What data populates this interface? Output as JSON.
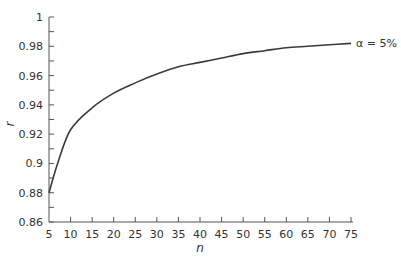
{
  "chart_data": {
    "type": "line",
    "title": "",
    "xlabel": "n",
    "ylabel": "r",
    "xlim": [
      5,
      75
    ],
    "ylim": [
      0.86,
      1.0
    ],
    "grid": false,
    "x_ticks": [
      5,
      10,
      15,
      20,
      25,
      30,
      35,
      40,
      45,
      50,
      55,
      60,
      65,
      70,
      75
    ],
    "y_ticks": [
      0.86,
      0.88,
      0.9,
      0.92,
      0.94,
      0.96,
      0.98,
      1
    ],
    "y_tick_labels": [
      "0.86",
      "0.88",
      "0.9",
      "0.92",
      "0.94",
      "0.96",
      "0.98",
      "1"
    ],
    "y_minor_step": 0.01,
    "series": [
      {
        "name": "α = 5%",
        "x": [
          5,
          7,
          10,
          15,
          20,
          25,
          30,
          35,
          40,
          45,
          50,
          55,
          60,
          65,
          70,
          75
        ],
        "values": [
          0.88,
          0.9,
          0.923,
          0.938,
          0.948,
          0.955,
          0.961,
          0.966,
          0.969,
          0.972,
          0.975,
          0.977,
          0.979,
          0.98,
          0.981,
          0.982
        ]
      }
    ],
    "annotations": [
      {
        "text": "α = 5%",
        "position": "right end of curve"
      }
    ]
  },
  "colors": {
    "axis": "#555555",
    "line": "#3a3a3a",
    "text": "#333333"
  }
}
